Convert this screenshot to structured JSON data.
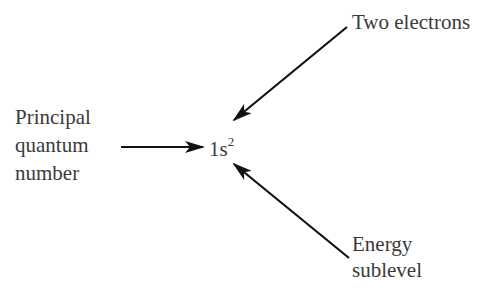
{
  "diagram": {
    "type": "electron-configuration-notation",
    "center": {
      "base": "1s",
      "superscript": "2"
    },
    "labels": {
      "principal": [
        "Principal",
        "quantum",
        "number"
      ],
      "electrons": "Two electrons",
      "sublevel": [
        "Energy",
        "sublevel"
      ]
    },
    "colors": {
      "text": "#3a3a3a",
      "arrow": "#111111",
      "background": "#ffffff"
    }
  }
}
